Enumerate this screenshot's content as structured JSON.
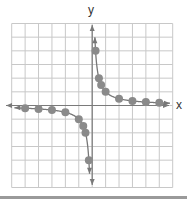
{
  "chart_data": {
    "type": "scatter",
    "title": "",
    "function": "y = 1/x",
    "xlabel": "x",
    "ylabel": "y",
    "xlim": [
      -6,
      6
    ],
    "ylim": [
      -6,
      6
    ],
    "grid": true,
    "grid_step": 1,
    "series": [
      {
        "name": "right branch",
        "points": [
          [
            0.25,
            4
          ],
          [
            0.5,
            2
          ],
          [
            0.6667,
            1.5
          ],
          [
            1,
            1
          ],
          [
            2,
            0.5
          ],
          [
            3,
            0.3333
          ],
          [
            4,
            0.25
          ],
          [
            5,
            0.2
          ]
        ]
      },
      {
        "name": "left branch",
        "points": [
          [
            -5,
            -0.2
          ],
          [
            -4,
            -0.25
          ],
          [
            -3,
            -0.3333
          ],
          [
            -2,
            -0.5
          ],
          [
            -1,
            -1
          ],
          [
            -0.6667,
            -1.5
          ],
          [
            -0.5,
            -2
          ],
          [
            -0.25,
            -4
          ]
        ]
      }
    ],
    "colors": {
      "grid": "#c8c8c8",
      "axis": "#7a7a7a",
      "curve": "#777777",
      "marker": "#8a8a8a"
    }
  },
  "labels": {
    "x_axis": "x",
    "y_axis": "y"
  }
}
